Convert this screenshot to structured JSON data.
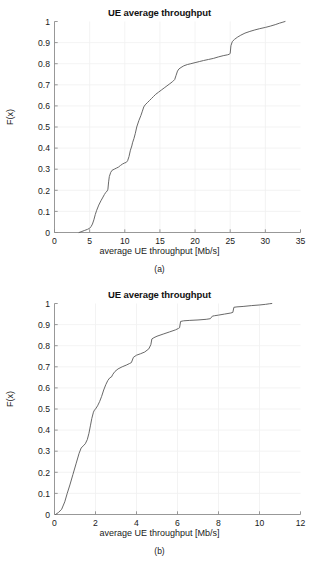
{
  "figure": {
    "panels": [
      {
        "id": "a",
        "title": "UE average throughput",
        "xlabel": "average UE throughput [Mb/s]",
        "ylabel": "F(x)",
        "caption": "(a)"
      },
      {
        "id": "b",
        "title": "UE average throughput",
        "xlabel": "average UE throughput [Mb/s]",
        "ylabel": "F(x)",
        "caption": "(b)"
      }
    ]
  },
  "colors": {
    "curve": "#606060",
    "axis": "#8c8c8c",
    "grid": "#f0f0f0",
    "background": "#ffffff",
    "text": "#1a1a1a"
  },
  "chart_data": [
    {
      "type": "line",
      "id": "a",
      "title": "UE average throughput",
      "xlabel": "average UE throughput [Mb/s]",
      "ylabel": "F(x)",
      "xlim": [
        0,
        35
      ],
      "ylim": [
        0,
        1
      ],
      "xticks": [
        0,
        5,
        10,
        15,
        20,
        25,
        30,
        35
      ],
      "xticklabels": [
        "0",
        "5",
        "10",
        "15",
        "20",
        "25",
        "30",
        "35"
      ],
      "yticks": [
        0,
        0.1,
        0.2,
        0.3,
        0.4,
        0.5,
        0.6,
        0.7,
        0.8,
        0.9,
        1
      ],
      "yticklabels": [
        "0",
        "0.1",
        "0.2",
        "0.3",
        "0.4",
        "0.5",
        "0.6",
        "0.7",
        "0.8",
        "0.9",
        "1"
      ],
      "grid": true,
      "legend": null,
      "series": [
        {
          "name": "empirical CDF",
          "x": [
            3.5,
            3.9,
            4.3,
            4.7,
            5.0,
            5.2,
            5.4,
            5.6,
            5.8,
            6.0,
            6.3,
            6.6,
            6.9,
            7.1,
            7.3,
            7.5,
            7.6,
            7.7,
            7.8,
            8.0,
            8.2,
            8.5,
            8.8,
            9.1,
            9.4,
            9.7,
            10.0,
            10.2,
            10.4,
            10.6,
            10.8,
            11.0,
            11.1,
            11.3,
            11.5,
            11.7,
            12.0,
            12.3,
            12.5,
            12.7,
            12.9,
            13.2,
            13.5,
            13.8,
            14.1,
            14.4,
            14.8,
            15.2,
            15.6,
            16.0,
            16.4,
            16.8,
            17.1,
            17.3,
            17.5,
            17.7,
            18.0,
            18.4,
            18.9,
            19.4,
            20.0,
            20.6,
            21.2,
            21.9,
            22.6,
            23.3,
            24.0,
            24.6,
            24.9,
            25.0,
            25.1,
            25.3,
            25.6,
            26.0,
            26.5,
            27.1,
            27.8,
            28.5,
            29.2,
            30.0,
            30.7,
            31.4,
            32.0,
            32.5,
            32.8
          ],
          "y": [
            0.0,
            0.005,
            0.01,
            0.015,
            0.02,
            0.028,
            0.04,
            0.06,
            0.085,
            0.105,
            0.13,
            0.15,
            0.168,
            0.18,
            0.19,
            0.197,
            0.205,
            0.24,
            0.265,
            0.285,
            0.295,
            0.3,
            0.305,
            0.31,
            0.318,
            0.325,
            0.33,
            0.332,
            0.34,
            0.36,
            0.39,
            0.41,
            0.425,
            0.445,
            0.47,
            0.5,
            0.53,
            0.555,
            0.575,
            0.595,
            0.605,
            0.615,
            0.625,
            0.635,
            0.645,
            0.655,
            0.665,
            0.675,
            0.685,
            0.695,
            0.705,
            0.715,
            0.725,
            0.745,
            0.765,
            0.775,
            0.782,
            0.79,
            0.796,
            0.8,
            0.805,
            0.81,
            0.815,
            0.82,
            0.825,
            0.832,
            0.838,
            0.842,
            0.845,
            0.85,
            0.885,
            0.905,
            0.915,
            0.925,
            0.935,
            0.945,
            0.953,
            0.96,
            0.966,
            0.972,
            0.978,
            0.985,
            0.992,
            0.997,
            1.0
          ]
        }
      ]
    },
    {
      "type": "line",
      "id": "b",
      "title": "UE average throughput",
      "xlabel": "average UE throughput [Mb/s]",
      "ylabel": "F(x)",
      "xlim": [
        0,
        12
      ],
      "ylim": [
        0,
        1
      ],
      "xticks": [
        0,
        2,
        4,
        6,
        8,
        10,
        12
      ],
      "xticklabels": [
        "0",
        "2",
        "4",
        "6",
        "8",
        "10",
        "12"
      ],
      "yticks": [
        0,
        0.1,
        0.2,
        0.3,
        0.4,
        0.5,
        0.6,
        0.7,
        0.8,
        0.9,
        1
      ],
      "yticklabels": [
        "0",
        "0.1",
        "0.2",
        "0.3",
        "0.4",
        "0.5",
        "0.6",
        "0.7",
        "0.8",
        "0.9",
        "1"
      ],
      "grid": true,
      "legend": null,
      "series": [
        {
          "name": "empirical CDF",
          "x": [
            0.05,
            0.2,
            0.35,
            0.5,
            0.62,
            0.75,
            0.9,
            1.05,
            1.2,
            1.3,
            1.4,
            1.5,
            1.6,
            1.68,
            1.75,
            1.82,
            1.9,
            1.95,
            2.0,
            2.1,
            2.2,
            2.3,
            2.4,
            2.5,
            2.6,
            2.7,
            2.78,
            2.85,
            2.95,
            3.1,
            3.3,
            3.5,
            3.65,
            3.75,
            3.85,
            4.0,
            4.2,
            4.4,
            4.6,
            4.7,
            4.75,
            4.85,
            5.0,
            5.3,
            5.6,
            5.9,
            6.05,
            6.1,
            6.15,
            6.3,
            6.6,
            7.0,
            7.4,
            7.6,
            7.7,
            7.8,
            8.0,
            8.3,
            8.6,
            8.7,
            8.75,
            8.9,
            9.2,
            9.6,
            10.0,
            10.3,
            10.5,
            10.6
          ],
          "y": [
            0.0,
            0.01,
            0.025,
            0.06,
            0.1,
            0.14,
            0.19,
            0.24,
            0.29,
            0.315,
            0.325,
            0.335,
            0.355,
            0.385,
            0.42,
            0.455,
            0.485,
            0.495,
            0.5,
            0.515,
            0.535,
            0.56,
            0.59,
            0.615,
            0.635,
            0.648,
            0.652,
            0.665,
            0.678,
            0.69,
            0.7,
            0.708,
            0.715,
            0.72,
            0.745,
            0.755,
            0.762,
            0.77,
            0.785,
            0.805,
            0.832,
            0.838,
            0.845,
            0.855,
            0.865,
            0.875,
            0.882,
            0.885,
            0.915,
            0.918,
            0.92,
            0.922,
            0.925,
            0.928,
            0.94,
            0.942,
            0.945,
            0.95,
            0.955,
            0.958,
            0.982,
            0.984,
            0.986,
            0.99,
            0.993,
            0.996,
            0.999,
            1.0
          ]
        }
      ]
    }
  ]
}
